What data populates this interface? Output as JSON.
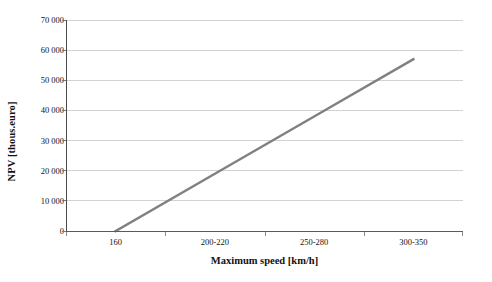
{
  "chart_data": {
    "type": "line",
    "title": "",
    "subtitle": "",
    "xlabel": "Maximum speed [km/h]",
    "ylabel": "NPV [thous.euro]",
    "categories": [
      "160",
      "200-220",
      "250-280",
      "300-350"
    ],
    "series": [
      {
        "name": "NPV",
        "values": [
          0,
          19000,
          38000,
          57000
        ],
        "color": "#808080"
      }
    ],
    "ylim": [
      0,
      70000
    ],
    "ytick_step": 10000,
    "ytick_labels": [
      "0",
      "10 000",
      "20 000",
      "30 000",
      "40 000",
      "50 000",
      "60 000",
      "70 000"
    ],
    "ytick_values": [
      0,
      10000,
      20000,
      30000,
      40000,
      50000,
      60000,
      70000
    ],
    "grid": "horizontal",
    "legend": "none",
    "legend_position": "",
    "annotations": [],
    "background_color": "#ffffff",
    "gridline_color": "#d2d2d2",
    "axis_color": "#4a4a4a"
  }
}
